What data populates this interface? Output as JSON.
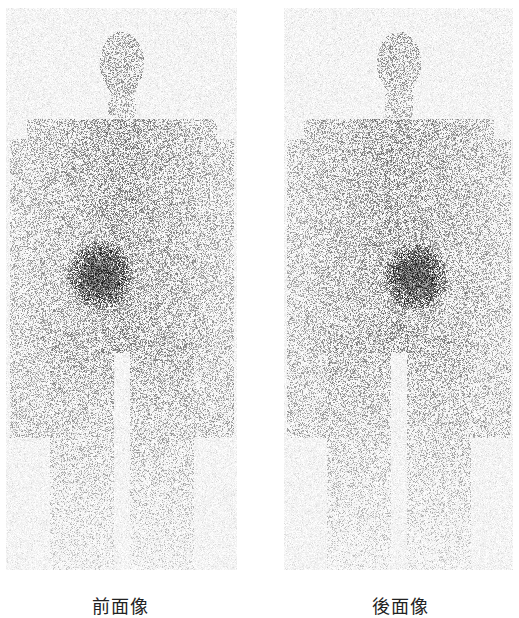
{
  "figure": {
    "type": "whole-body scintigraphy",
    "panels": [
      {
        "id": "anterior",
        "label": "前面像",
        "view": "anterior",
        "hot_spot": "mid-abdomen"
      },
      {
        "id": "posterior",
        "label": "後面像",
        "view": "posterior",
        "hot_spot": "mid-abdomen"
      }
    ],
    "colors": {
      "background": "#ffffff",
      "counts": "#1a1a1a",
      "hot_spot": "#000000"
    }
  }
}
